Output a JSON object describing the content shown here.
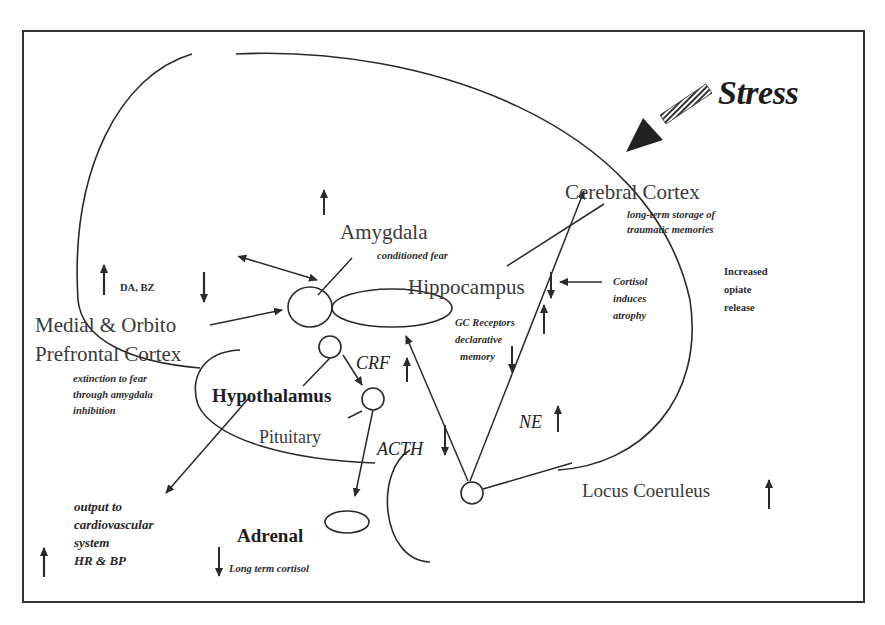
{
  "title": "Stress",
  "regions": {
    "cerebral_cortex": "Cerebral Cortex",
    "amygdala": "Amygdala",
    "hippocampus": "Hippocampus",
    "prefrontal_line1": "Medial &  Orbito",
    "prefrontal_line2": "Prefrontal Cortex",
    "hypothalamus": "Hypothalamus",
    "pituitary": "Pituitary",
    "adrenal": "Adrenal",
    "locus_coeruleus": "Locus  Coeruleus"
  },
  "notes": {
    "cortex_line1": "long-term storage of",
    "cortex_line2": "traumatic memories",
    "amygdala_note": "conditioned fear",
    "cortisol_line1": "Cortisol",
    "cortisol_line2": "induces",
    "cortisol_line3": "atrophy",
    "opiate_line1": "Increased",
    "opiate_line2": "opiate",
    "opiate_line3": "release",
    "gc_line1": "GC Receptors",
    "gc_line2": "declarative",
    "gc_line3": "memory",
    "da_bz": "DA,    BZ",
    "extinction_line1": "extinction to fear",
    "extinction_line2": "through amygdala",
    "extinction_line3": "inhibition",
    "output_line1": "output to",
    "output_line2": "cardiovascular",
    "output_line3": "system",
    "output_line4": "HR & BP",
    "adrenal_note": "Long term cortisol"
  },
  "hormones": {
    "crf": "CRF",
    "acth": "ACTH",
    "ne": "NE"
  },
  "indicators": {
    "amygdala": "up",
    "hippocampus": "down",
    "gc_receptors": "up",
    "declarative_memory": "down",
    "da": "up",
    "bz": "down",
    "crf": "up",
    "acth": "down",
    "ne": "up",
    "locus_coeruleus": "up",
    "hr_bp": "up",
    "long_term_cortisol": "down"
  },
  "colors": {
    "ink": "#2a2a2a",
    "frame": "#333333",
    "background": "#ffffff"
  }
}
